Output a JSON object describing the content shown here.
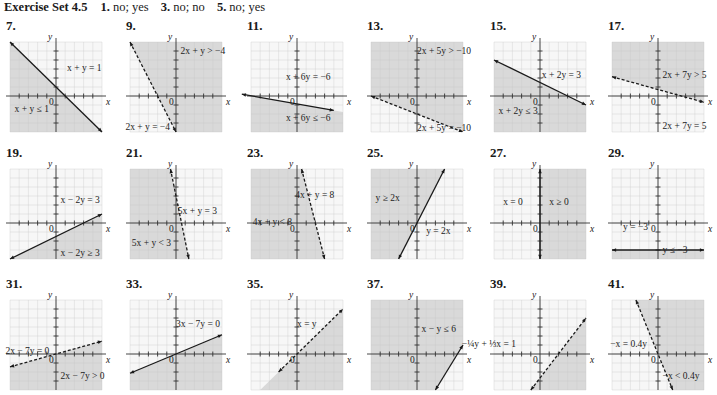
{
  "header": {
    "set_title": "Exercise Set 4.5",
    "answers": [
      {
        "num": "1.",
        "text": "no; yes"
      },
      {
        "num": "3.",
        "text": "no; no"
      },
      {
        "num": "5.",
        "text": "no; yes"
      }
    ]
  },
  "colors": {
    "shade": "#d9d9d9",
    "grid_light": "#e6e6e6",
    "grid_shaded": "#c8c8c8",
    "line": "#1a1a1a"
  },
  "axis_labels": {
    "x": "x",
    "y": "y",
    "origin": "0"
  },
  "exercises": [
    {
      "num": "7.",
      "boundary": "x + y = 1",
      "inequality": "x + y ≤ 1",
      "line": "solid",
      "shade": "below",
      "p1": [
        -5,
        6
      ],
      "p2": [
        5,
        -4
      ],
      "eq_pos": [
        0.62,
        0.32
      ],
      "ineq_pos": [
        0.05,
        0.78
      ]
    },
    {
      "num": "9.",
      "boundary": "2x + y = −4",
      "inequality": "2x + y > −4",
      "line": "dashed",
      "shade": "right",
      "p1": [
        -5,
        6
      ],
      "p2": [
        0,
        -4
      ],
      "eq_pos": [
        -0.05,
        0.98
      ],
      "ineq_pos": [
        0.55,
        0.13
      ]
    },
    {
      "num": "11.",
      "boundary": "x + 6y = −6",
      "inequality": "x + 6y ≤ −6",
      "line": "solid",
      "shade": "below",
      "p1": [
        -6,
        0.2
      ],
      "p2": [
        4,
        -1.6
      ],
      "eq_pos": [
        0.38,
        0.42
      ],
      "ineq_pos": [
        0.38,
        0.88
      ]
    },
    {
      "num": "13.",
      "boundary": "2x + 5y = −10",
      "inequality": "2x + 5y > −10",
      "line": "dashed",
      "shade": "above",
      "p1": [
        -5,
        0
      ],
      "p2": [
        5,
        -4
      ],
      "eq_pos": [
        0.5,
        0.99
      ],
      "ineq_pos": [
        0.5,
        0.13
      ]
    },
    {
      "num": "15.",
      "boundary": "x + 2y = 3",
      "inequality": "x + 2y ≤ 3",
      "line": "solid",
      "shade": "below",
      "p1": [
        -5,
        4
      ],
      "p2": [
        5,
        -1
      ],
      "eq_pos": [
        0.52,
        0.4
      ],
      "ineq_pos": [
        0.05,
        0.8
      ]
    },
    {
      "num": "17.",
      "boundary": "2x + 7y = 5",
      "inequality": "2x + 7y > 5",
      "line": "dashed",
      "shade": "above",
      "p1": [
        -5,
        2.14
      ],
      "p2": [
        5,
        -0.7
      ],
      "eq_pos": [
        0.55,
        0.97
      ],
      "ineq_pos": [
        0.55,
        0.4
      ]
    },
    {
      "num": "19.",
      "boundary": "x − 2y = 3",
      "inequality": "x − 2y ≥ 3",
      "line": "solid",
      "shade": "below",
      "p1": [
        -5,
        -4
      ],
      "p2": [
        5,
        1
      ],
      "eq_pos": [
        0.55,
        0.38
      ],
      "ineq_pos": [
        0.55,
        0.97
      ]
    },
    {
      "num": "21.",
      "boundary": "5x + y = 3",
      "inequality": "5x + y < 3",
      "line": "dashed",
      "shade": "left",
      "p1": [
        -0.6,
        6
      ],
      "p2": [
        1.4,
        -4
      ],
      "eq_pos": [
        0.52,
        0.5
      ],
      "ineq_pos": [
        0.02,
        0.85
      ]
    },
    {
      "num": "23.",
      "boundary": "4x + y = 8",
      "inequality": "4x + y < 8",
      "line": "dashed",
      "shade": "left",
      "p1": [
        0.5,
        6
      ],
      "p2": [
        3,
        -4
      ],
      "eq_pos": [
        0.48,
        0.32
      ],
      "ineq_pos": [
        0.02,
        0.62
      ]
    },
    {
      "num": "25.",
      "boundary": "y = 2x",
      "inequality": "y ≥ 2x",
      "line": "solid",
      "shade": "left",
      "p1": [
        -2,
        -4
      ],
      "p2": [
        3,
        6
      ],
      "eq_pos": [
        0.6,
        0.72
      ],
      "ineq_pos": [
        0.05,
        0.35
      ]
    },
    {
      "num": "27.",
      "boundary": "x = 0",
      "inequality": "x ≥ 0",
      "line": "solid",
      "shade": "right",
      "p1": [
        0,
        6
      ],
      "p2": [
        0,
        -4
      ],
      "eq_pos": [
        0.1,
        0.4
      ],
      "ineq_pos": [
        0.6,
        0.4
      ]
    },
    {
      "num": "29.",
      "boundary": "y = −3",
      "inequality": "y ≤ −3",
      "line": "solid",
      "shade": "below",
      "p1": [
        -5,
        -3
      ],
      "p2": [
        5,
        -3
      ],
      "eq_pos": [
        0.12,
        0.68
      ],
      "ineq_pos": [
        0.55,
        0.93
      ]
    },
    {
      "num": "31.",
      "boundary": "2x − 7y = 0",
      "inequality": "2x − 7y > 0",
      "line": "dashed",
      "shade": "below",
      "p1": [
        -5,
        -1.43
      ],
      "p2": [
        5,
        1.43
      ],
      "eq_pos": [
        -0.05,
        0.6
      ],
      "ineq_pos": [
        0.55,
        0.88
      ]
    },
    {
      "num": "33.",
      "boundary": "3x − 7y = 0",
      "inequality": "",
      "line": "solid",
      "shade": "below",
      "p1": [
        -5,
        -2.14
      ],
      "p2": [
        5,
        2.14
      ],
      "eq_pos": [
        0.5,
        0.3
      ],
      "ineq_pos": [
        0,
        0
      ]
    },
    {
      "num": "35.",
      "boundary": "x = y",
      "inequality": "",
      "line": "dashed",
      "shade": "below",
      "p1": [
        -2,
        -2
      ],
      "p2": [
        5,
        5
      ],
      "eq_pos": [
        0.5,
        0.3
      ],
      "ineq_pos": [
        0,
        0
      ]
    },
    {
      "num": "37.",
      "boundary": "",
      "inequality": "x − y ≤ 6",
      "line": "solid",
      "shade": "above",
      "p1": [
        2,
        -4
      ],
      "p2": [
        5,
        1
      ],
      "eq_pos": [
        0,
        0
      ],
      "ineq_pos": [
        0.55,
        0.35
      ]
    },
    {
      "num": "39.",
      "boundary": "−¼y + ⅓x = 1",
      "inequality": "",
      "line": "dashed",
      "shade": "below",
      "p1": [
        -1,
        -4
      ],
      "p2": [
        5,
        4
      ],
      "eq_pos": [
        -0.35,
        0.52
      ],
      "ineq_pos": [
        0,
        0
      ]
    },
    {
      "num": "41.",
      "boundary": "−x = 0.4y",
      "inequality": "−x < 0.4y",
      "line": "dashed",
      "shade": "right",
      "p1": [
        -2.4,
        6
      ],
      "p2": [
        1.6,
        -4
      ],
      "eq_pos": [
        -0.02,
        0.52
      ],
      "ineq_pos": [
        0.55,
        0.88
      ]
    }
  ]
}
